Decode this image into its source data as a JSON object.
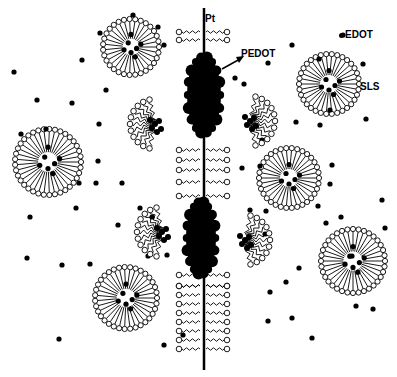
{
  "labels": {
    "electrode": "Pt",
    "polymer": "PEDOT",
    "monomer": "EDOT",
    "surfactant": "SLS"
  },
  "colors": {
    "ink": "#000000",
    "background": "#ffffff"
  },
  "electrode": {
    "x": 204,
    "y1": 8,
    "y2": 370
  },
  "deposits": [
    {
      "cx": 204,
      "cy": 95,
      "rx": 17,
      "ry": 40
    },
    {
      "cx": 201,
      "cy": 238,
      "rx": 15,
      "ry": 38
    }
  ],
  "micelles": [
    {
      "cx": 131,
      "cy": 47,
      "r": 28
    },
    {
      "cx": 329,
      "cy": 84,
      "r": 30
    },
    {
      "cx": 48,
      "cy": 162,
      "r": 33
    },
    {
      "cx": 289,
      "cy": 178,
      "r": 30
    },
    {
      "cx": 353,
      "cy": 261,
      "r": 32
    },
    {
      "cx": 126,
      "cy": 298,
      "r": 31
    }
  ],
  "hemimicelles": [
    {
      "cx": 155,
      "cy": 124,
      "side": "left"
    },
    {
      "cx": 250,
      "cy": 121,
      "side": "right"
    },
    {
      "cx": 162,
      "cy": 232,
      "side": "left"
    },
    {
      "cx": 245,
      "cy": 240,
      "side": "right"
    }
  ],
  "free_edot_dots": [
    [
      133,
      15
    ],
    [
      100,
      33
    ],
    [
      158,
      27
    ],
    [
      164,
      45
    ],
    [
      82,
      60
    ],
    [
      106,
      90
    ],
    [
      14,
      72
    ],
    [
      235,
      78
    ],
    [
      219,
      79
    ],
    [
      268,
      63
    ],
    [
      292,
      45
    ],
    [
      343,
      35
    ],
    [
      319,
      59
    ],
    [
      363,
      64
    ],
    [
      366,
      119
    ],
    [
      320,
      125
    ],
    [
      330,
      110
    ],
    [
      296,
      122
    ],
    [
      262,
      140
    ],
    [
      244,
      84
    ],
    [
      72,
      103
    ],
    [
      99,
      124
    ],
    [
      98,
      161
    ],
    [
      21,
      134
    ],
    [
      46,
      129
    ],
    [
      79,
      183
    ],
    [
      30,
      217
    ],
    [
      76,
      208
    ],
    [
      96,
      183
    ],
    [
      122,
      183
    ],
    [
      140,
      208
    ],
    [
      118,
      225
    ],
    [
      152,
      217
    ],
    [
      250,
      210
    ],
    [
      242,
      168
    ],
    [
      260,
      166
    ],
    [
      332,
      165
    ],
    [
      330,
      184
    ],
    [
      318,
      206
    ],
    [
      326,
      223
    ],
    [
      341,
      217
    ],
    [
      266,
      211
    ],
    [
      299,
      268
    ],
    [
      356,
      306
    ],
    [
      373,
      309
    ],
    [
      382,
      200
    ],
    [
      385,
      228
    ],
    [
      90,
      264
    ],
    [
      62,
      265
    ],
    [
      59,
      339
    ],
    [
      164,
      345
    ],
    [
      148,
      256
    ],
    [
      167,
      255
    ],
    [
      265,
      234
    ],
    [
      286,
      282
    ],
    [
      270,
      292
    ],
    [
      268,
      321
    ],
    [
      292,
      318
    ],
    [
      312,
      338
    ],
    [
      352,
      256
    ],
    [
      183,
      335
    ],
    [
      27,
      258
    ],
    [
      37,
      100
    ]
  ]
}
